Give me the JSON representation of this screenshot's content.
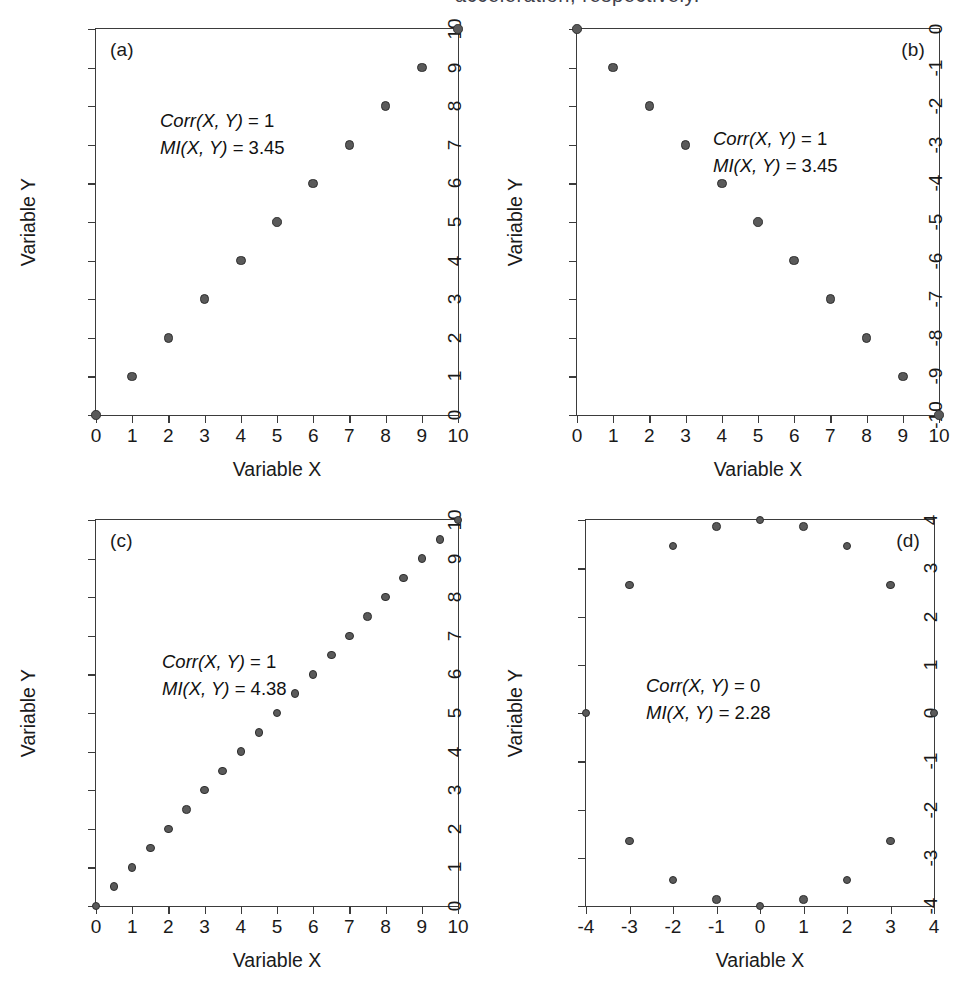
{
  "figure": {
    "background_color": "#ffffff",
    "marker_color": "#5a5a5a",
    "marker_edge_color": "#2e2e2e",
    "axis_color": "#3b3b3b",
    "cropped_top_caption": "acceleration, respectively."
  },
  "labels": {
    "xaxis_title": "Variable X",
    "yaxis_title": "Variable Y",
    "corr_name": "Corr(X, Y)",
    "mi_name": "MI(X, Y)",
    "equals": " = "
  },
  "chart_data": [
    {
      "type": "scatter",
      "panel": "(a)",
      "title": "",
      "xlabel": "Variable X",
      "ylabel": "Variable Y",
      "xlim": [
        0,
        10
      ],
      "ylim": [
        0,
        10
      ],
      "xticks": [
        0,
        1,
        2,
        3,
        4,
        5,
        6,
        7,
        8,
        9,
        10
      ],
      "yticks": [
        0,
        1,
        2,
        3,
        4,
        5,
        6,
        7,
        8,
        9,
        10
      ],
      "grid": false,
      "legend": "none",
      "annotations": {
        "corr_label": "Corr(X, Y)",
        "corr_value": "1",
        "mi_label": "MI(X, Y)",
        "mi_value": "3.45"
      },
      "x": [
        0,
        1,
        2,
        3,
        4,
        5,
        6,
        7,
        8,
        9,
        10
      ],
      "y": [
        0,
        1,
        2,
        3,
        4,
        5,
        6,
        7,
        8,
        9,
        10
      ]
    },
    {
      "type": "scatter",
      "panel": "(b)",
      "title": "",
      "xlabel": "Variable X",
      "ylabel": "Variable Y",
      "xlim": [
        0,
        10
      ],
      "ylim": [
        -10,
        0
      ],
      "xticks": [
        0,
        1,
        2,
        3,
        4,
        5,
        6,
        7,
        8,
        9,
        10
      ],
      "yticks": [
        0,
        -1,
        -2,
        -3,
        -4,
        -5,
        -6,
        -7,
        -8,
        -9,
        -10
      ],
      "grid": false,
      "legend": "none",
      "annotations": {
        "corr_label": "Corr(X, Y)",
        "corr_value": "1",
        "mi_label": "MI(X, Y)",
        "mi_value": "3.45"
      },
      "x": [
        0,
        1,
        2,
        3,
        4,
        5,
        6,
        7,
        8,
        9,
        10
      ],
      "y": [
        0,
        -1,
        -2,
        -3,
        -4,
        -5,
        -6,
        -7,
        -8,
        -9,
        -10
      ]
    },
    {
      "type": "scatter",
      "panel": "(c)",
      "title": "",
      "xlabel": "Variable X",
      "ylabel": "Variable Y",
      "xlim": [
        0,
        10
      ],
      "ylim": [
        0,
        10
      ],
      "xticks": [
        0,
        1,
        2,
        3,
        4,
        5,
        6,
        7,
        8,
        9,
        10
      ],
      "yticks": [
        0,
        1,
        2,
        3,
        4,
        5,
        6,
        7,
        8,
        9,
        10
      ],
      "grid": false,
      "legend": "none",
      "annotations": {
        "corr_label": "Corr(X, Y)",
        "corr_value": "1",
        "mi_label": "MI(X, Y)",
        "mi_value": "4.38"
      },
      "x": [
        0,
        0.5,
        1,
        1.5,
        2,
        2.5,
        3,
        3.5,
        4,
        4.5,
        5,
        5.5,
        6,
        6.5,
        7,
        7.5,
        8,
        8.5,
        9,
        9.5,
        10
      ],
      "y": [
        0,
        0.5,
        1,
        1.5,
        2,
        2.5,
        3,
        3.5,
        4,
        4.5,
        5,
        5.5,
        6,
        6.5,
        7,
        7.5,
        8,
        8.5,
        9,
        9.5,
        10
      ]
    },
    {
      "type": "scatter",
      "panel": "(d)",
      "title": "",
      "xlabel": "Variable X",
      "ylabel": "Variable Y",
      "xlim": [
        -4,
        4
      ],
      "ylim": [
        -4,
        4
      ],
      "xticks": [
        -4,
        -3,
        -2,
        -1,
        0,
        1,
        2,
        3,
        4
      ],
      "yticks": [
        -4,
        -3,
        -2,
        -1,
        0,
        1,
        2,
        3,
        4
      ],
      "grid": false,
      "legend": "none",
      "annotations": {
        "corr_label": "Corr(X, Y)",
        "corr_value": "0",
        "mi_label": "MI(X, Y)",
        "mi_value": "2.28"
      },
      "x": [
        -4,
        -3,
        -2,
        -1,
        0,
        1,
        2,
        3,
        4,
        -3,
        -2,
        -1,
        0,
        1,
        2,
        3
      ],
      "y": [
        0,
        2.65,
        3.46,
        3.87,
        4,
        3.87,
        3.46,
        2.65,
        0,
        -2.65,
        -3.46,
        -3.87,
        -4,
        -3.87,
        -3.46,
        -2.65
      ]
    }
  ]
}
